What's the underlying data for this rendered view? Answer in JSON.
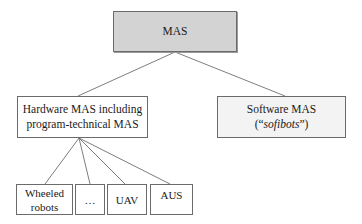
{
  "diagram": {
    "root": {
      "label": "MAS",
      "fill": "#d3d3d3"
    },
    "hardware": {
      "line1": "Hardware MAS including",
      "line2": "program-technical MAS",
      "fill": "#ffffff"
    },
    "software": {
      "line1": "Software MAS",
      "line2_prefix": "(“",
      "line2_italic": "sofibots",
      "line2_suffix": "”)",
      "fill": "#f3f3f3"
    },
    "leaves": [
      {
        "line1": "Wheeled",
        "line2": "robots"
      },
      {
        "line1": "…",
        "line2": ""
      },
      {
        "line1": "UAV",
        "line2": ""
      },
      {
        "line1": "AUS",
        "line2": ""
      }
    ],
    "edges": [
      {
        "from": "MAS",
        "to": "Hardware MAS including program-technical MAS"
      },
      {
        "from": "MAS",
        "to": "Software MAS (“sofibots”)"
      },
      {
        "from": "Hardware MAS including program-technical MAS",
        "to": "Wheeled robots"
      },
      {
        "from": "Hardware MAS including program-technical MAS",
        "to": "…"
      },
      {
        "from": "Hardware MAS including program-technical MAS",
        "to": "UAV"
      },
      {
        "from": "Hardware MAS including program-technical MAS",
        "to": "AUS"
      }
    ],
    "line_color": "#6e6e6e",
    "border_color": "#6b6b6b"
  }
}
